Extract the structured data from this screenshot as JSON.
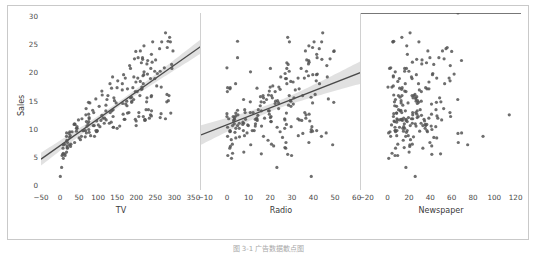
{
  "figure": {
    "ylabel": "Sales",
    "caption": "图 3-1  广告数据散点图",
    "point_color": "#555555",
    "line_color": "#4a4a4a",
    "band_color": "#cfcfcf",
    "frame_color": "#c9c9c9",
    "background": "#ffffff"
  },
  "chart_data": [
    {
      "type": "scatter",
      "title": "",
      "xlabel": "TV",
      "ylabel": "Sales",
      "xlim": [
        -50,
        370
      ],
      "ylim": [
        -0.8,
        30.5
      ],
      "xticks": [
        -50,
        0,
        50,
        100,
        150,
        200,
        250,
        300,
        350
      ],
      "yticks": [
        0,
        5,
        10,
        15,
        20,
        25,
        30
      ],
      "grid": false,
      "legend": "none",
      "regression": {
        "slope": 0.04754,
        "intercept": 7.0326,
        "ci": 0.95,
        "shown": true
      },
      "x": [
        230.1,
        44.5,
        17.2,
        151.5,
        180.8,
        8.7,
        57.5,
        120.2,
        8.6,
        199.8,
        66.1,
        214.7,
        23.8,
        97.5,
        204.1,
        195.4,
        67.8,
        281.4,
        69.2,
        147.3,
        218.4,
        237.4,
        13.2,
        228.3,
        62.3,
        262.9,
        142.9,
        240.1,
        248.8,
        70.6,
        292.9,
        112.9,
        97.2,
        265.6,
        95.7,
        290.7,
        266.9,
        74.7,
        43.1,
        228.0,
        202.5,
        177.0,
        293.6,
        206.9,
        25.1,
        175.1,
        89.7,
        239.9,
        227.2,
        66.9,
        199.8,
        100.4,
        216.4,
        182.6,
        262.7,
        198.9,
        7.3,
        136.2,
        210.8,
        210.7,
        53.5,
        261.3,
        239.3,
        102.7,
        131.1,
        69.0,
        31.5,
        139.3,
        237.4,
        216.8,
        199.1,
        109.8,
        26.8,
        129.4,
        213.4,
        16.9,
        27.5,
        120.5,
        5.4,
        116.0,
        76.4,
        239.8,
        75.3,
        68.4,
        213.5,
        193.2,
        76.3,
        110.7,
        88.3,
        109.8,
        134.3,
        28.6,
        217.7,
        250.9,
        107.4,
        163.3,
        197.6,
        184.9,
        289.7,
        135.2,
        222.4,
        296.4,
        280.2,
        187.9,
        238.2,
        137.9,
        25.0,
        90.4,
        13.1,
        255.4,
        225.8,
        241.7,
        175.7,
        209.6,
        78.2,
        75.1,
        139.2,
        76.4,
        125.7,
        19.4,
        141.3,
        18.8,
        224.0,
        123.1,
        229.5,
        87.2,
        7.8,
        80.2,
        220.3,
        59.6,
        0.7,
        265.2,
        8.4,
        219.8,
        36.9,
        48.3,
        25.6,
        273.7,
        43.0,
        184.9,
        73.4,
        193.7,
        220.5,
        104.6,
        96.2,
        140.3,
        240.1,
        243.2,
        38.0,
        44.7,
        280.7,
        121.0,
        197.6,
        171.3,
        187.8,
        4.1,
        93.9,
        149.8,
        11.7,
        131.7,
        172.5,
        85.7,
        188.4,
        163.5,
        117.2,
        234.5,
        17.9,
        206.8,
        215.4,
        284.3,
        50.0,
        164.5,
        19.6,
        168.4,
        222.4,
        276.9,
        248.4,
        170.2,
        276.7,
        165.6,
        156.6,
        218.5,
        56.2,
        287.6,
        253.8,
        205.0,
        139.5,
        191.1,
        286.0,
        18.7,
        39.5,
        75.5,
        17.2,
        166.8,
        149.7,
        38.2,
        94.2,
        177.0,
        283.6,
        232.1
      ],
      "y": [
        22.1,
        10.4,
        9.3,
        18.5,
        12.9,
        7.2,
        11.8,
        13.2,
        4.8,
        10.6,
        8.6,
        17.4,
        9.2,
        9.7,
        19.0,
        22.4,
        12.5,
        24.4,
        11.3,
        14.6,
        18.0,
        12.5,
        5.6,
        15.5,
        9.7,
        12.0,
        15.0,
        15.9,
        18.9,
        10.5,
        21.4,
        11.9,
        9.6,
        17.4,
        9.5,
        12.8,
        25.4,
        14.7,
        10.1,
        21.5,
        16.6,
        17.1,
        20.7,
        12.9,
        8.5,
        14.9,
        10.6,
        23.2,
        14.8,
        9.7,
        11.4,
        10.7,
        22.6,
        21.2,
        20.2,
        23.7,
        5.5,
        13.2,
        23.8,
        18.4,
        8.1,
        24.2,
        15.7,
        14.0,
        18.0,
        9.3,
        9.5,
        13.4,
        18.9,
        22.3,
        18.3,
        12.4,
        8.8,
        11.0,
        17.0,
        8.7,
        6.9,
        14.2,
        5.3,
        11.0,
        11.8,
        12.3,
        11.3,
        13.6,
        21.7,
        15.2,
        12.0,
        16.0,
        12.9,
        16.7,
        11.2,
        7.3,
        19.4,
        22.2,
        11.5,
        16.9,
        11.7,
        15.5,
        25.4,
        17.2,
        11.7,
        23.8,
        14.8,
        14.7,
        20.7,
        19.2,
        7.2,
        8.7,
        5.3,
        19.8,
        13.4,
        21.8,
        14.1,
        15.9,
        14.6,
        12.6,
        12.2,
        9.4,
        15.9,
        6.6,
        15.5,
        7.0,
        11.6,
        15.2,
        19.7,
        10.6,
        6.6,
        8.8,
        24.7,
        9.7,
        1.6,
        12.7,
        5.7,
        19.6,
        10.8,
        11.6,
        9.5,
        20.8,
        9.6,
        20.7,
        10.9,
        19.2,
        20.1,
        10.4,
        11.4,
        10.3,
        13.2,
        25.4,
        10.9,
        10.1,
        16.1,
        11.6,
        16.6,
        19.0,
        15.6,
        3.2,
        15.3,
        10.1,
        7.3,
        12.9,
        14.4,
        13.3,
        14.9,
        18.0,
        11.9,
        11.9,
        8.0,
        12.2,
        17.1,
        15.0,
        8.4,
        14.5,
        7.6,
        11.7,
        11.5,
        27.0,
        20.2,
        11.7,
        11.8,
        12.6,
        10.5,
        12.2,
        8.7,
        26.2,
        17.6,
        22.6,
        10.3,
        17.3,
        15.9,
        6.7,
        10.8,
        9.9,
        5.9,
        19.6,
        17.3,
        7.6,
        9.7,
        12.8,
        25.5,
        13.4
      ]
    },
    {
      "type": "scatter",
      "title": "",
      "xlabel": "Radio",
      "ylabel": "Sales",
      "xlim": [
        -12,
        62
      ],
      "ylim": [
        -0.8,
        30.5
      ],
      "xticks": [
        -10,
        0,
        10,
        20,
        30,
        40,
        50,
        60
      ],
      "yticks": [
        0,
        5,
        10,
        15,
        20,
        25,
        30
      ],
      "grid": false,
      "legend": "none",
      "regression": {
        "slope": 0.2025,
        "intercept": 9.3116,
        "ci": 0.95,
        "shown": true
      },
      "x": [
        37.8,
        39.3,
        45.9,
        41.3,
        10.8,
        48.9,
        32.8,
        19.6,
        2.1,
        2.6,
        5.8,
        24.0,
        35.1,
        7.6,
        32.9,
        47.7,
        36.6,
        39.6,
        20.5,
        23.9,
        27.7,
        5.1,
        15.9,
        16.9,
        12.6,
        3.5,
        29.3,
        16.7,
        27.1,
        16.0,
        28.3,
        17.4,
        1.5,
        20.0,
        1.4,
        4.1,
        43.8,
        49.4,
        26.7,
        37.7,
        22.3,
        33.4,
        27.7,
        8.4,
        25.7,
        22.5,
        9.9,
        41.5,
        15.8,
        11.7,
        3.1,
        9.6,
        41.7,
        46.2,
        28.8,
        49.4,
        28.1,
        19.2,
        49.6,
        29.5,
        2.0,
        42.7,
        15.5,
        29.6,
        42.8,
        9.3,
        24.6,
        14.5,
        27.5,
        43.9,
        30.6,
        14.3,
        33.0,
        5.7,
        24.6,
        43.7,
        1.6,
        28.5,
        29.9,
        7.7,
        26.7,
        4.1,
        20.3,
        23.9,
        27.7,
        18.3,
        20.1,
        19.2,
        12.1,
        19.6,
        7.4,
        20.6,
        37.7,
        36.9,
        14.0,
        31.6,
        3.5,
        21.0,
        28.9,
        13.9,
        8.6,
        36.3,
        10.8,
        17.2,
        34.3,
        46.4,
        11.0,
        0.3,
        0.4,
        26.9,
        8.2,
        38.0,
        15.4,
        20.6,
        39.6,
        19.6,
        2.9,
        3.7,
        28.8,
        1.3,
        31.0,
        21.6,
        3.2,
        7.7,
        41.8,
        4.9,
        27.2,
        8.1,
        37.9,
        1.4,
        39.0,
        0.0,
        2.6,
        39.7,
        27.5,
        33.5,
        38.9,
        0.0,
        39.6,
        20.1,
        13.2,
        24.9,
        10.9,
        29.7,
        38.3,
        0.3,
        15.9,
        40.3,
        3.4,
        4.1,
        40.8,
        26.8,
        0.2,
        35.8,
        38.9,
        23.1,
        46.9,
        5.7,
        2.5,
        36.0,
        30.7,
        4.9,
        29.6,
        4.0,
        13.8,
        36.5,
        19.0,
        20.4,
        1.4,
        23.4,
        4.1,
        22.3,
        37.9,
        13.8,
        34.6,
        44.3,
        36.8,
        13.1,
        0.8,
        38.0,
        13.1,
        0.0,
        16.9,
        28.1,
        21.2,
        4.9,
        23.2,
        0.3,
        35.0,
        26.8,
        7.3,
        39.0,
        7.8,
        41.4,
        1.5,
        27.3,
        41.5,
        27.5,
        4.9
      ],
      "y": [
        22.1,
        10.4,
        9.3,
        18.5,
        12.9,
        7.2,
        11.8,
        13.2,
        4.8,
        10.6,
        8.6,
        17.4,
        9.2,
        9.7,
        19.0,
        22.4,
        12.5,
        24.4,
        11.3,
        14.6,
        18.0,
        12.5,
        5.6,
        15.5,
        9.7,
        12.0,
        15.0,
        15.9,
        18.9,
        10.5,
        21.4,
        11.9,
        9.6,
        17.4,
        9.5,
        12.8,
        25.4,
        14.7,
        10.1,
        21.5,
        16.6,
        17.1,
        20.7,
        12.9,
        8.5,
        14.9,
        10.6,
        23.2,
        14.8,
        9.7,
        11.4,
        10.7,
        22.6,
        21.2,
        20.2,
        23.7,
        5.5,
        13.2,
        23.8,
        18.4,
        8.1,
        24.2,
        15.7,
        14.0,
        18.0,
        9.3,
        9.5,
        13.4,
        18.9,
        22.3,
        18.3,
        12.4,
        8.8,
        11.0,
        17.0,
        8.7,
        6.9,
        14.2,
        5.3,
        11.0,
        11.8,
        12.3,
        11.3,
        13.6,
        21.7,
        15.2,
        12.0,
        16.0,
        12.9,
        16.7,
        11.2,
        7.3,
        19.4,
        22.2,
        11.5,
        16.9,
        11.7,
        15.5,
        25.4,
        17.2,
        11.7,
        23.8,
        14.8,
        14.7,
        20.7,
        19.2,
        7.2,
        8.7,
        5.3,
        19.8,
        13.4,
        21.8,
        14.1,
        15.9,
        14.6,
        12.6,
        12.2,
        9.4,
        15.9,
        6.6,
        15.5,
        7.0,
        11.6,
        15.2,
        19.7,
        10.6,
        6.6,
        8.8,
        24.7,
        9.7,
        1.6,
        12.7,
        5.7,
        19.6,
        10.8,
        11.6,
        9.5,
        20.8,
        9.6,
        20.7,
        10.9,
        19.2,
        20.1,
        10.4,
        11.4,
        10.3,
        13.2,
        25.4,
        10.9,
        10.1,
        16.1,
        11.6,
        16.6,
        19.0,
        15.6,
        3.2,
        15.3,
        10.1,
        7.3,
        12.9,
        14.4,
        13.3,
        14.9,
        18.0,
        11.9,
        11.9,
        8.0,
        12.2,
        17.1,
        15.0,
        8.4,
        14.5,
        7.6,
        11.7,
        11.5,
        27.0,
        20.2,
        11.7,
        11.8,
        12.6,
        10.5,
        12.2,
        8.7,
        26.2,
        17.6,
        22.6,
        10.3,
        17.3,
        15.9,
        6.7,
        10.8,
        9.9,
        5.9,
        19.6,
        17.3,
        7.6,
        9.7,
        12.8,
        25.5,
        13.4
      ]
    },
    {
      "type": "scatter",
      "title": "",
      "xlabel": "Newspaper",
      "ylabel": "Sales",
      "xlim": [
        -25,
        125
      ],
      "ylim": [
        -0.8,
        30.5
      ],
      "xticks": [
        -20,
        0,
        20,
        40,
        60,
        80,
        100,
        120
      ],
      "yticks": [
        0,
        5,
        10,
        15,
        20,
        25,
        30
      ],
      "grid": false,
      "legend": "none",
      "regression": {
        "slope": 0.0547,
        "intercept": 12.3514,
        "ci": 0.95,
        "shown": true
      },
      "x": [
        69.2,
        45.1,
        69.3,
        58.5,
        58.4,
        75.0,
        23.5,
        11.6,
        1.0,
        21.2,
        24.2,
        4.0,
        65.9,
        7.2,
        46.0,
        52.9,
        114.0,
        55.8,
        18.3,
        19.1,
        53.4,
        23.5,
        49.6,
        26.2,
        18.3,
        19.5,
        12.6,
        22.9,
        22.9,
        40.8,
        43.2,
        38.6,
        30.0,
        0.3,
        7.4,
        8.5,
        5.0,
        45.7,
        35.1,
        32.0,
        31.6,
        38.7,
        1.8,
        26.4,
        43.3,
        31.5,
        35.7,
        18.5,
        49.9,
        36.8,
        34.6,
        3.6,
        39.6,
        58.7,
        15.9,
        60.0,
        41.4,
        16.6,
        37.7,
        9.5,
        21.4,
        54.7,
        27.3,
        8.4,
        28.9,
        0.9,
        2.2,
        10.2,
        11.0,
        27.2,
        38.7,
        31.7,
        19.3,
        31.3,
        13.1,
        89.4,
        20.7,
        14.2,
        9.4,
        23.1,
        22.3,
        46.2,
        6.4,
        52.5,
        36.4,
        65.7,
        27.7,
        5.7,
        23.4,
        16.0,
        8.4,
        23.1,
        5.3,
        32.2,
        13.8,
        29.7,
        13.3,
        48.7,
        29.3,
        11.2,
        17.3,
        51.4,
        6.4,
        29.0,
        15.9,
        22.3,
        20.8,
        2.8,
        6.9,
        42.3,
        30.5,
        23.2,
        6.6,
        10.1,
        12.6,
        27.4,
        5.4,
        17.6,
        24.6,
        7.4,
        23.8,
        41.3,
        11.2,
        7.3,
        62.3,
        33.0,
        33.0,
        8.5,
        17.9,
        6.9,
        25.8,
        5.7,
        4.1,
        26.9,
        35.2,
        50.6,
        37.3,
        2.9,
        14.8,
        17.6,
        25.9,
        5.3,
        7.1,
        15.1,
        6.0,
        6.9,
        27.7,
        4.9,
        15.6,
        14.2,
        25.6,
        9.1,
        17.2,
        57.6,
        11.6,
        17.1,
        26.4,
        15.9,
        9.5,
        13.2,
        41.1,
        12.4,
        26.7,
        16.5,
        47.0,
        15.0,
        14.6,
        28.7,
        36.9,
        28.1,
        46.0,
        27.8,
        39.6,
        34.1,
        17.2,
        21.0,
        19.9,
        12.6,
        8.7,
        41.1,
        26.6,
        59.0,
        16.9,
        13.3,
        5.3,
        48.0,
        11.1,
        13.6,
        13.4,
        15.5,
        36.7,
        41.5,
        20.1,
        42.0,
        35.6,
        66.2,
        8.7,
        8.2,
        5.7,
        45.3,
        65.9
      ],
      "y": [
        22.1,
        10.4,
        9.3,
        18.5,
        12.9,
        7.2,
        11.8,
        13.2,
        4.8,
        10.6,
        8.6,
        17.4,
        9.2,
        9.7,
        19.0,
        22.4,
        12.5,
        24.4,
        11.3,
        14.6,
        18.0,
        12.5,
        5.6,
        15.5,
        9.7,
        12.0,
        15.0,
        15.9,
        18.9,
        10.5,
        21.4,
        11.9,
        9.6,
        17.4,
        9.5,
        12.8,
        25.4,
        14.7,
        10.1,
        21.5,
        16.6,
        17.1,
        20.7,
        12.9,
        8.5,
        14.9,
        10.6,
        23.2,
        14.8,
        9.7,
        11.4,
        10.7,
        22.6,
        21.2,
        20.2,
        23.7,
        5.5,
        13.2,
        23.8,
        18.4,
        8.1,
        24.2,
        15.7,
        14.0,
        18.0,
        9.3,
        9.5,
        13.4,
        18.9,
        22.3,
        18.3,
        12.4,
        8.8,
        11.0,
        17.0,
        8.7,
        6.9,
        14.2,
        5.3,
        11.0,
        11.8,
        12.3,
        11.3,
        13.6,
        21.7,
        15.2,
        12.0,
        16.0,
        12.9,
        16.7,
        11.2,
        7.3,
        19.4,
        22.2,
        11.5,
        16.9,
        11.7,
        15.5,
        25.4,
        17.2,
        11.7,
        23.8,
        14.8,
        14.7,
        20.7,
        19.2,
        7.2,
        8.7,
        5.3,
        19.8,
        13.4,
        21.8,
        14.1,
        15.9,
        14.6,
        12.6,
        12.2,
        9.4,
        15.9,
        6.6,
        15.5,
        7.0,
        11.6,
        15.2,
        19.7,
        10.6,
        6.6,
        8.8,
        24.7,
        9.7,
        1.6,
        12.7,
        5.7,
        19.6,
        10.8,
        11.6,
        9.5,
        20.8,
        9.6,
        20.7,
        10.9,
        19.2,
        20.1,
        10.4,
        11.4,
        10.3,
        13.2,
        25.4,
        10.9,
        10.1,
        16.1,
        11.6,
        16.6,
        19.0,
        15.6,
        3.2,
        15.3,
        10.1,
        7.3,
        12.9,
        14.4,
        13.3,
        14.9,
        18.0,
        11.9,
        11.9,
        8.0,
        12.2,
        17.1,
        15.0,
        8.4,
        14.5,
        7.6,
        11.7,
        11.5,
        27.0,
        20.2,
        11.7,
        11.8,
        12.6,
        10.5,
        12.2,
        8.7,
        26.2,
        17.6,
        22.6,
        10.3,
        17.3,
        15.9,
        6.7,
        10.8,
        9.9,
        5.9,
        19.6,
        17.3,
        7.6,
        9.7,
        12.8,
        25.5,
        13.4
      ]
    }
  ]
}
